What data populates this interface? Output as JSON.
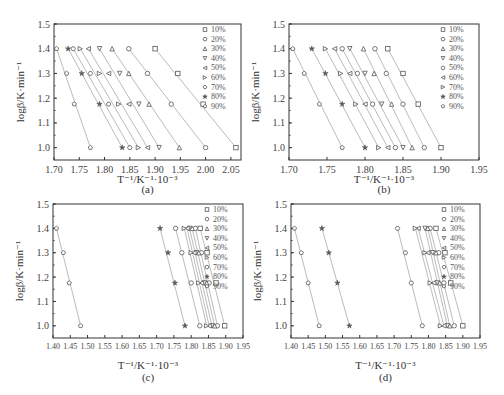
{
  "chart_data": [
    {
      "panel": "(a)",
      "type": "scatter",
      "title": "",
      "xlabel": "T⁻¹/K⁻¹·10⁻³",
      "ylabel": "logβ/K·min⁻¹",
      "xlim": [
        1.7,
        2.07
      ],
      "ylim": [
        0.95,
        1.5
      ],
      "xticks": [
        "1.70",
        "1.75",
        "1.80",
        "1.85",
        "1.90",
        "1.95",
        "2.00",
        "2.05"
      ],
      "yticks": [
        "1.0",
        "1.1",
        "1.2",
        "1.3",
        "1.4",
        "1.5"
      ],
      "y": [
        1.4,
        1.3,
        1.176,
        1.0
      ],
      "series": [
        {
          "name": "10%",
          "marker": "square",
          "x": [
            1.9,
            1.945,
            1.995,
            2.06
          ]
        },
        {
          "name": "20%",
          "marker": "circle",
          "x": [
            1.848,
            1.885,
            1.932,
            2.0
          ]
        },
        {
          "name": "30%",
          "marker": "triangle-up",
          "x": [
            1.815,
            1.848,
            1.888,
            1.948
          ]
        },
        {
          "name": "40%",
          "marker": "triangle-down",
          "x": [
            1.79,
            1.83,
            1.868,
            1.908
          ]
        },
        {
          "name": "50%",
          "marker": "triangle-left",
          "x": [
            1.768,
            1.808,
            1.848,
            1.885
          ]
        },
        {
          "name": "60%",
          "marker": "triangle-right",
          "x": [
            1.752,
            1.79,
            1.828,
            1.867
          ]
        },
        {
          "name": "70%",
          "marker": "hexagon",
          "x": [
            1.738,
            1.772,
            1.808,
            1.85
          ]
        },
        {
          "name": "80%",
          "marker": "star",
          "x": [
            1.728,
            1.755,
            1.79,
            1.835
          ]
        },
        {
          "name": "90%",
          "marker": "pentagon",
          "x": [
            1.705,
            1.725,
            1.74,
            1.772
          ]
        }
      ],
      "legend_position": "upper right",
      "grid": false
    },
    {
      "panel": "(b)",
      "type": "scatter",
      "title": "",
      "xlabel": "T⁻¹/K⁻¹·10⁻³",
      "ylabel": "logβ/K·min⁻¹",
      "xlim": [
        1.7,
        1.95
      ],
      "ylim": [
        0.95,
        1.5
      ],
      "xticks": [
        "1.70",
        "1.75",
        "1.80",
        "1.85",
        "1.90",
        "1.95"
      ],
      "yticks": [
        "1.0",
        "1.1",
        "1.2",
        "1.3",
        "1.4",
        "1.5"
      ],
      "y": [
        1.4,
        1.3,
        1.176,
        1.0
      ],
      "series": [
        {
          "name": "10%",
          "marker": "square",
          "x": [
            1.83,
            1.85,
            1.87,
            1.9
          ]
        },
        {
          "name": "20%",
          "marker": "circle",
          "x": [
            1.813,
            1.828,
            1.85,
            1.878
          ]
        },
        {
          "name": "30%",
          "marker": "triangle-up",
          "x": [
            1.798,
            1.812,
            1.835,
            1.862
          ]
        },
        {
          "name": "40%",
          "marker": "triangle-down",
          "x": [
            1.78,
            1.8,
            1.822,
            1.85
          ]
        },
        {
          "name": "50%",
          "marker": "circle",
          "x": [
            1.77,
            1.79,
            1.81,
            1.84
          ]
        },
        {
          "name": "60%",
          "marker": "triangle-left",
          "x": [
            1.76,
            1.78,
            1.8,
            1.83
          ]
        },
        {
          "name": "70%",
          "marker": "triangle-right",
          "x": [
            1.748,
            1.768,
            1.788,
            1.818
          ]
        },
        {
          "name": "80%",
          "marker": "star",
          "x": [
            1.73,
            1.748,
            1.77,
            1.8
          ]
        },
        {
          "name": "90%",
          "marker": "pentagon",
          "x": [
            1.705,
            1.72,
            1.74,
            1.77
          ]
        }
      ],
      "legend_position": "upper right",
      "grid": false
    },
    {
      "panel": "(c)",
      "type": "scatter",
      "title": "",
      "xlabel": "T⁻¹/K⁻¹·10⁻³",
      "ylabel": "logβ/K·min⁻¹",
      "xlim": [
        1.4,
        1.95
      ],
      "ylim": [
        0.95,
        1.5
      ],
      "xticks": [
        "1.40",
        "1.45",
        "1.50",
        "1.55",
        "1.60",
        "1.65",
        "1.70",
        "1.75",
        "1.80",
        "1.85",
        "1.90",
        "1.95"
      ],
      "yticks": [
        "1.0",
        "1.1",
        "1.2",
        "1.3",
        "1.4",
        "1.5"
      ],
      "y": [
        1.4,
        1.3,
        1.176,
        1.0
      ],
      "series": [
        {
          "name": "10%",
          "marker": "square",
          "x": [
            1.826,
            1.846,
            1.872,
            1.897
          ]
        },
        {
          "name": "20%",
          "marker": "circle",
          "x": [
            1.812,
            1.83,
            1.852,
            1.876
          ]
        },
        {
          "name": "30%",
          "marker": "triangle-up",
          "x": [
            1.803,
            1.822,
            1.845,
            1.868
          ]
        },
        {
          "name": "40%",
          "marker": "triangle-down",
          "x": [
            1.795,
            1.815,
            1.838,
            1.86
          ]
        },
        {
          "name": "50%",
          "marker": "triangle-left",
          "x": [
            1.788,
            1.808,
            1.83,
            1.852
          ]
        },
        {
          "name": "60%",
          "marker": "triangle-right",
          "x": [
            1.78,
            1.8,
            1.822,
            1.845
          ]
        },
        {
          "name": "70%",
          "marker": "circle",
          "x": [
            1.755,
            1.773,
            1.8,
            1.825
          ]
        },
        {
          "name": "80%",
          "marker": "star",
          "x": [
            1.71,
            1.733,
            1.753,
            1.782
          ]
        },
        {
          "name": "90%",
          "marker": "pentagon",
          "x": [
            1.41,
            1.43,
            1.447,
            1.48
          ]
        }
      ],
      "legend_position": "upper right",
      "grid": false
    },
    {
      "panel": "(d)",
      "type": "scatter",
      "title": "",
      "xlabel": "T⁻¹/K⁻¹·10⁻³",
      "ylabel": "logβ/K·min⁻¹",
      "xlim": [
        1.4,
        1.95
      ],
      "ylim": [
        0.95,
        1.5
      ],
      "xticks": [
        "1.40",
        "1.45",
        "1.50",
        "1.55",
        "1.60",
        "1.65",
        "1.70",
        "1.75",
        "1.80",
        "1.85",
        "1.90",
        "1.95"
      ],
      "yticks": [
        "1.0",
        "1.1",
        "1.2",
        "1.3",
        "1.4",
        "1.5"
      ],
      "y": [
        1.4,
        1.3,
        1.176,
        1.0
      ],
      "series": [
        {
          "name": "10%",
          "marker": "square",
          "x": [
            1.822,
            1.848,
            1.865,
            1.9
          ]
        },
        {
          "name": "20%",
          "marker": "circle",
          "x": [
            1.805,
            1.83,
            1.845,
            1.875
          ]
        },
        {
          "name": "30%",
          "marker": "triangle-up",
          "x": [
            1.798,
            1.822,
            1.833,
            1.862
          ]
        },
        {
          "name": "40%",
          "marker": "triangle-down",
          "x": [
            1.79,
            1.812,
            1.825,
            1.855
          ]
        },
        {
          "name": "50%",
          "marker": "triangle-left",
          "x": [
            1.77,
            1.798,
            1.815,
            1.845
          ]
        },
        {
          "name": "60%",
          "marker": "triangle-right",
          "x": [
            1.762,
            1.79,
            1.805,
            1.835
          ]
        },
        {
          "name": "70%",
          "marker": "hexagon",
          "x": [
            1.71,
            1.733,
            1.75,
            1.782
          ]
        },
        {
          "name": "80%",
          "marker": "star",
          "x": [
            1.49,
            1.51,
            1.535,
            1.57
          ]
        },
        {
          "name": "90%",
          "marker": "pentagon",
          "x": [
            1.41,
            1.43,
            1.45,
            1.482
          ]
        }
      ],
      "legend_position": "upper right",
      "grid": false
    }
  ],
  "panels": [
    {
      "label": "(a)",
      "xlabel_main": "T",
      "xlabel_sup": "−1",
      "xlabel_rest": "/K",
      "xlabel_sup2": "−1",
      "xlabel_tail": "·10",
      "xlabel_sup3": "−3"
    },
    {
      "label": "(b)"
    },
    {
      "label": "(c)"
    },
    {
      "label": "(d)"
    }
  ],
  "ylabel": "logβ/K·min⁻¹",
  "xlabel": "T⁻¹/K⁻¹·10⁻³",
  "legend_labels": [
    "10%",
    "20%",
    "30%",
    "40%",
    "50%",
    "60%",
    "70%",
    "80%",
    "90%"
  ]
}
